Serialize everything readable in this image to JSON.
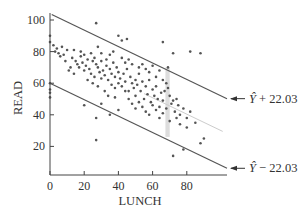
{
  "chart_data": {
    "type": "scatter",
    "title": "",
    "xlabel": "LUNCH",
    "ylabel": "READ",
    "xlim": [
      0,
      103
    ],
    "ylim": [
      0,
      105
    ],
    "x_ticks": [
      0,
      20,
      40,
      60,
      80
    ],
    "y_ticks": [
      20,
      40,
      60,
      80,
      100
    ],
    "grid": false,
    "legend": null,
    "regression_line": {
      "intercept": 82,
      "slope": -0.52,
      "color": "#cccccc"
    },
    "prediction_band": {
      "offset": 22.03,
      "color": "#555555"
    },
    "annotations": [
      {
        "text_base": "Ŷ",
        "text_suffix": " + 22.03",
        "points_to": "upper_band_line"
      },
      {
        "text_base": "Ŷ",
        "text_suffix": " − 22.03",
        "points_to": "lower_band_line"
      }
    ],
    "highlight_band": {
      "x_from": 67.5,
      "x_to": 70,
      "y_from": 26,
      "y_to": 70,
      "color": "#dddddd"
    },
    "series": [
      {
        "name": "observations",
        "color": "#555555",
        "points": [
          [
            0,
            90
          ],
          [
            0,
            86
          ],
          [
            0,
            60
          ],
          [
            0,
            56
          ],
          [
            0,
            54
          ],
          [
            0,
            51
          ],
          [
            2,
            84
          ],
          [
            3,
            80
          ],
          [
            4,
            82
          ],
          [
            5,
            79
          ],
          [
            6,
            77
          ],
          [
            7,
            83
          ],
          [
            8,
            78
          ],
          [
            10,
            81
          ],
          [
            9,
            74
          ],
          [
            12,
            70
          ],
          [
            11,
            68
          ],
          [
            13,
            76
          ],
          [
            15,
            74
          ],
          [
            14,
            66
          ],
          [
            16,
            72
          ],
          [
            17,
            70
          ],
          [
            18,
            80
          ],
          [
            19,
            73
          ],
          [
            20,
            78
          ],
          [
            20,
            68
          ],
          [
            21,
            71
          ],
          [
            22,
            75
          ],
          [
            23,
            69
          ],
          [
            24,
            66
          ],
          [
            25,
            74
          ],
          [
            22,
            62
          ],
          [
            25,
            60
          ],
          [
            26,
            64
          ],
          [
            27,
            72
          ],
          [
            28,
            70
          ],
          [
            29,
            67
          ],
          [
            30,
            74
          ],
          [
            30,
            63
          ],
          [
            31,
            68
          ],
          [
            32,
            65
          ],
          [
            33,
            71
          ],
          [
            34,
            62
          ],
          [
            35,
            69
          ],
          [
            36,
            66
          ],
          [
            37,
            73
          ],
          [
            38,
            64
          ],
          [
            38,
            57
          ],
          [
            39,
            70
          ],
          [
            40,
            67
          ],
          [
            40,
            60
          ],
          [
            41,
            63
          ],
          [
            42,
            58
          ],
          [
            43,
            66
          ],
          [
            44,
            61
          ],
          [
            45,
            69
          ],
          [
            46,
            55
          ],
          [
            47,
            64
          ],
          [
            48,
            60
          ],
          [
            49,
            57
          ],
          [
            50,
            62
          ],
          [
            50,
            52
          ],
          [
            51,
            59
          ],
          [
            52,
            66
          ],
          [
            53,
            55
          ],
          [
            54,
            61
          ],
          [
            55,
            50
          ],
          [
            56,
            58
          ],
          [
            57,
            53
          ],
          [
            58,
            62
          ],
          [
            59,
            48
          ],
          [
            60,
            56
          ],
          [
            61,
            52
          ],
          [
            62,
            58
          ],
          [
            63,
            50
          ],
          [
            64,
            45
          ],
          [
            65,
            54
          ],
          [
            66,
            49
          ],
          [
            67,
            55
          ],
          [
            68,
            60
          ],
          [
            68,
            44
          ],
          [
            69,
            57
          ],
          [
            70,
            52
          ],
          [
            71,
            47
          ],
          [
            72,
            49
          ],
          [
            73,
            42
          ],
          [
            74,
            50
          ],
          [
            75,
            46
          ],
          [
            76,
            40
          ],
          [
            78,
            44
          ],
          [
            80,
            38
          ],
          [
            82,
            42
          ],
          [
            85,
            35
          ],
          [
            88,
            22
          ],
          [
            90,
            25
          ],
          [
            27,
            98
          ],
          [
            40,
            90
          ],
          [
            42,
            87
          ],
          [
            45,
            88
          ],
          [
            28,
            83
          ],
          [
            66,
            86
          ],
          [
            72,
            79
          ],
          [
            82,
            80
          ],
          [
            88,
            79
          ],
          [
            69,
            70
          ],
          [
            20,
            46
          ],
          [
            27,
            38
          ],
          [
            27,
            24
          ],
          [
            72,
            14
          ],
          [
            78,
            18
          ],
          [
            35,
            40
          ],
          [
            40,
            43
          ],
          [
            30,
            47
          ],
          [
            14,
            81
          ],
          [
            18,
            77
          ],
          [
            24,
            79
          ],
          [
            26,
            76
          ],
          [
            30,
            79
          ],
          [
            33,
            75
          ],
          [
            35,
            78
          ],
          [
            37,
            80
          ],
          [
            42,
            76
          ],
          [
            44,
            73
          ],
          [
            46,
            75
          ],
          [
            48,
            72
          ],
          [
            52,
            70
          ],
          [
            54,
            72
          ],
          [
            56,
            69
          ],
          [
            58,
            67
          ],
          [
            60,
            71
          ],
          [
            62,
            64
          ],
          [
            64,
            68
          ],
          [
            66,
            62
          ],
          [
            28,
            58
          ],
          [
            32,
            55
          ],
          [
            34,
            52
          ],
          [
            36,
            59
          ],
          [
            38,
            51
          ],
          [
            44,
            55
          ],
          [
            46,
            50
          ],
          [
            48,
            47
          ],
          [
            50,
            44
          ],
          [
            52,
            48
          ],
          [
            54,
            45
          ],
          [
            56,
            42
          ],
          [
            58,
            40
          ],
          [
            60,
            46
          ],
          [
            62,
            43
          ],
          [
            64,
            38
          ],
          [
            66,
            41
          ],
          [
            70,
            36
          ],
          [
            74,
            38
          ],
          [
            76,
            34
          ],
          [
            80,
            32
          ]
        ]
      }
    ]
  }
}
